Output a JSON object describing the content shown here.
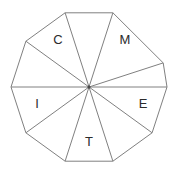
{
  "figure": {
    "name": "decagon-sector-wheel",
    "shape_type": "regular-decagon",
    "sides": 10,
    "sector_count": 10,
    "center": {
      "x": 89,
      "y": 87
    },
    "radius": 78,
    "rotation_degrees": 18,
    "background_color": "#ffffff",
    "stroke_color": "#808080",
    "stroke_width": 1,
    "label_color": "#2b2b2b",
    "center_dot_color": "#4a4a4a"
  },
  "labels": [
    {
      "id": "label-c",
      "text": "C",
      "sector_index": 8,
      "x": 58,
      "y": 41
    },
    {
      "id": "label-m",
      "text": "M",
      "sector_index": 0,
      "x": 125,
      "y": 41
    },
    {
      "id": "label-e",
      "text": "E",
      "sector_index": 2,
      "x": 143,
      "y": 105
    },
    {
      "id": "label-t",
      "text": "T",
      "sector_index": 4,
      "x": 89,
      "y": 143
    },
    {
      "id": "label-i",
      "text": "I",
      "sector_index": 6,
      "x": 37,
      "y": 105
    }
  ],
  "vertices": [
    {
      "x": 163.2,
      "y": 62.9
    },
    {
      "x": 167.0,
      "y": 87.0
    },
    {
      "x": 152.1,
      "y": 132.8
    },
    {
      "x": 112.9,
      "y": 161.2
    },
    {
      "x": 65.1,
      "y": 161.2
    },
    {
      "x": 25.9,
      "y": 132.8
    },
    {
      "x": 11.0,
      "y": 87.0
    },
    {
      "x": 25.9,
      "y": 41.2
    },
    {
      "x": 65.1,
      "y": 12.8
    },
    {
      "x": 112.9,
      "y": 12.8
    }
  ]
}
